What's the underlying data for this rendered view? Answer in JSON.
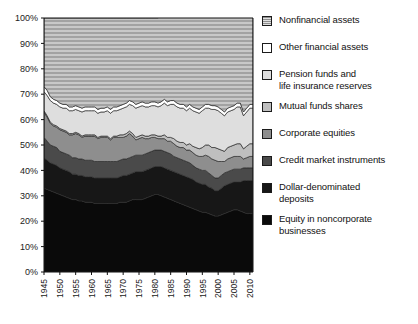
{
  "chart_data": {
    "type": "area",
    "title": "",
    "subtitle": "",
    "xlabel": "",
    "ylabel": "",
    "stacked": true,
    "normalized": true,
    "grid": false,
    "legend_position": "right",
    "xlim": [
      1945,
      2011
    ],
    "ylim": [
      0,
      100
    ],
    "yticks": [
      "0%",
      "10%",
      "20%",
      "30%",
      "40%",
      "50%",
      "60%",
      "70%",
      "80%",
      "90%",
      "100%"
    ],
    "ytick_values": [
      0,
      10,
      20,
      30,
      40,
      50,
      60,
      70,
      80,
      90,
      100
    ],
    "xticks": [
      "1945",
      "1950",
      "1955",
      "1960",
      "1965",
      "1970",
      "1975",
      "1980",
      "1985",
      "1990",
      "1995",
      "2000",
      "2005",
      "2010"
    ],
    "xtick_values": [
      1945,
      1950,
      1955,
      1960,
      1965,
      1970,
      1975,
      1980,
      1985,
      1990,
      1995,
      2000,
      2005,
      2010
    ],
    "x": [
      1945,
      1946,
      1947,
      1948,
      1949,
      1950,
      1951,
      1952,
      1953,
      1954,
      1955,
      1956,
      1957,
      1958,
      1959,
      1960,
      1961,
      1962,
      1963,
      1964,
      1965,
      1966,
      1967,
      1968,
      1969,
      1970,
      1971,
      1972,
      1973,
      1974,
      1975,
      1976,
      1977,
      1978,
      1979,
      1980,
      1981,
      1982,
      1983,
      1984,
      1985,
      1986,
      1987,
      1988,
      1989,
      1990,
      1991,
      1992,
      1993,
      1994,
      1995,
      1996,
      1997,
      1998,
      1999,
      2000,
      2001,
      2002,
      2003,
      2004,
      2005,
      2006,
      2007,
      2008,
      2009,
      2010,
      2011
    ],
    "series": [
      {
        "name": "Equity in noncorporate businesses",
        "color": "#0a0a0a",
        "pattern": "solid",
        "values": [
          33.0,
          32.5,
          32.0,
          31.5,
          31.0,
          30.5,
          30.0,
          29.5,
          29.0,
          28.5,
          28.5,
          28.0,
          28.0,
          27.5,
          27.5,
          27.5,
          27.0,
          27.0,
          27.0,
          27.0,
          27.0,
          27.0,
          27.0,
          27.0,
          27.5,
          27.5,
          27.5,
          28.0,
          28.5,
          28.5,
          28.5,
          28.5,
          29.0,
          29.5,
          30.0,
          30.5,
          30.5,
          30.0,
          29.5,
          29.0,
          28.5,
          28.0,
          27.5,
          27.0,
          26.5,
          26.0,
          25.5,
          25.0,
          24.5,
          24.0,
          23.5,
          23.5,
          23.0,
          22.5,
          22.0,
          22.0,
          22.5,
          23.0,
          23.5,
          24.0,
          24.5,
          24.5,
          24.0,
          23.5,
          23.0,
          23.0,
          23.0
        ]
      },
      {
        "name": "Dollar-denominated deposits",
        "color": "#171717",
        "pattern": "solid",
        "values": [
          12.0,
          11.5,
          11.0,
          11.0,
          11.0,
          10.5,
          10.5,
          10.5,
          10.5,
          10.0,
          10.0,
          10.0,
          10.0,
          10.0,
          10.0,
          10.0,
          10.0,
          10.0,
          10.0,
          10.0,
          10.0,
          10.0,
          10.0,
          10.0,
          10.0,
          10.5,
          10.5,
          10.5,
          10.5,
          11.0,
          11.0,
          11.0,
          11.0,
          11.0,
          11.0,
          11.0,
          11.0,
          11.5,
          11.5,
          11.5,
          11.5,
          11.5,
          11.5,
          11.5,
          11.5,
          11.5,
          11.5,
          11.5,
          11.0,
          11.0,
          11.0,
          11.0,
          10.5,
          10.5,
          10.0,
          10.0,
          10.5,
          11.0,
          11.0,
          11.0,
          11.0,
          11.0,
          11.5,
          12.5,
          13.0,
          13.0,
          13.0
        ]
      },
      {
        "name": "Credit market instruments",
        "color": "#4a4a4a",
        "pattern": "solid",
        "values": [
          8.0,
          7.5,
          7.0,
          7.0,
          7.0,
          6.5,
          6.5,
          6.5,
          6.5,
          6.5,
          6.5,
          6.5,
          6.5,
          6.5,
          6.5,
          6.5,
          6.5,
          6.5,
          6.5,
          6.5,
          6.5,
          6.5,
          6.5,
          6.5,
          6.5,
          6.5,
          6.5,
          6.5,
          6.5,
          6.5,
          6.5,
          6.5,
          6.5,
          6.5,
          6.5,
          6.5,
          6.5,
          6.5,
          6.5,
          6.5,
          6.5,
          6.0,
          6.0,
          6.0,
          6.0,
          6.0,
          6.0,
          5.5,
          5.5,
          5.5,
          5.5,
          5.5,
          5.5,
          5.0,
          5.0,
          5.0,
          5.0,
          5.0,
          5.0,
          5.0,
          5.0,
          5.0,
          5.0,
          5.0,
          5.0,
          5.0,
          5.0
        ]
      },
      {
        "name": "Corporate equities",
        "color": "#8e8e8e",
        "pattern": "solid",
        "values": [
          10.0,
          9.5,
          8.5,
          8.0,
          8.0,
          8.5,
          8.5,
          8.5,
          8.0,
          9.0,
          9.5,
          9.5,
          8.5,
          9.5,
          9.5,
          9.5,
          10.0,
          9.0,
          9.5,
          9.5,
          9.5,
          8.5,
          9.5,
          9.5,
          9.0,
          8.5,
          9.0,
          9.5,
          8.0,
          6.0,
          6.5,
          7.0,
          6.0,
          5.5,
          5.5,
          5.0,
          4.5,
          4.5,
          5.0,
          4.5,
          5.0,
          5.0,
          4.5,
          4.5,
          5.0,
          4.5,
          5.0,
          5.0,
          5.0,
          5.0,
          5.5,
          6.0,
          6.5,
          6.5,
          7.0,
          6.5,
          5.5,
          4.5,
          5.0,
          5.0,
          5.0,
          5.0,
          5.0,
          3.5,
          4.0,
          4.5,
          4.5
        ]
      },
      {
        "name": "Mutual funds shares",
        "color": "#bfbfbf",
        "pattern": "solid",
        "values": [
          0.5,
          0.5,
          0.5,
          0.5,
          0.5,
          0.5,
          0.5,
          0.5,
          0.5,
          0.5,
          0.5,
          0.5,
          0.5,
          0.5,
          0.5,
          0.5,
          0.5,
          0.5,
          0.5,
          0.5,
          0.5,
          0.5,
          0.5,
          0.5,
          1.0,
          1.0,
          1.0,
          1.0,
          1.0,
          1.0,
          1.0,
          1.0,
          1.0,
          1.0,
          1.0,
          1.0,
          1.0,
          1.0,
          1.5,
          1.5,
          1.5,
          2.0,
          2.0,
          2.0,
          2.0,
          2.0,
          2.5,
          2.5,
          3.0,
          3.0,
          3.5,
          4.0,
          4.5,
          4.5,
          5.0,
          5.0,
          4.5,
          4.0,
          4.5,
          4.5,
          4.5,
          5.0,
          5.0,
          4.0,
          4.5,
          5.0,
          5.0
        ]
      },
      {
        "name": "Pension funds and life insurance reserves",
        "color": "#dedede",
        "pattern": "solid",
        "values": [
          7.5,
          8.0,
          8.5,
          8.5,
          8.5,
          8.5,
          8.5,
          9.0,
          9.0,
          9.0,
          9.0,
          9.0,
          9.5,
          9.5,
          9.5,
          9.5,
          9.5,
          9.5,
          9.5,
          9.5,
          10.0,
          10.0,
          10.0,
          10.0,
          10.0,
          10.5,
          10.5,
          10.5,
          11.0,
          11.5,
          11.5,
          11.5,
          11.5,
          11.5,
          11.5,
          11.5,
          11.5,
          12.0,
          12.5,
          12.5,
          13.0,
          13.5,
          13.5,
          13.5,
          13.5,
          13.5,
          14.0,
          14.0,
          14.0,
          14.0,
          14.5,
          14.5,
          14.5,
          15.0,
          15.0,
          15.0,
          14.5,
          14.0,
          14.0,
          14.0,
          14.0,
          14.5,
          14.5,
          13.0,
          13.5,
          14.0,
          14.0
        ]
      },
      {
        "name": "Other financial assets",
        "color": "#ffffff",
        "pattern": "solid",
        "values": [
          2.0,
          2.0,
          1.5,
          1.5,
          1.5,
          1.5,
          1.5,
          1.5,
          1.5,
          1.5,
          1.5,
          1.5,
          1.5,
          1.5,
          1.5,
          1.5,
          1.5,
          1.5,
          1.5,
          1.5,
          1.5,
          1.5,
          1.5,
          1.5,
          1.5,
          1.5,
          1.5,
          1.5,
          1.5,
          1.5,
          1.5,
          1.5,
          1.5,
          1.5,
          1.5,
          1.5,
          1.5,
          1.5,
          1.5,
          1.5,
          1.5,
          1.5,
          1.5,
          1.5,
          1.5,
          1.5,
          1.5,
          1.5,
          1.5,
          1.5,
          1.5,
          1.5,
          1.5,
          1.5,
          1.5,
          1.5,
          1.5,
          1.5,
          1.5,
          1.5,
          1.5,
          1.5,
          1.5,
          1.5,
          1.5,
          1.5,
          1.5
        ]
      },
      {
        "name": "Nonfinancial assets",
        "color": "#b4b4b4",
        "pattern": "horizontal-stripes",
        "values": [
          27.0,
          28.5,
          31.0,
          32.0,
          32.5,
          33.5,
          34.0,
          34.0,
          35.0,
          35.0,
          34.5,
          35.0,
          35.5,
          35.0,
          35.0,
          35.0,
          35.0,
          36.0,
          35.5,
          35.5,
          35.0,
          36.0,
          35.0,
          35.0,
          34.5,
          34.0,
          33.5,
          32.5,
          33.0,
          34.0,
          33.5,
          33.0,
          33.5,
          33.5,
          33.0,
          33.0,
          33.5,
          34.0,
          33.5,
          34.5,
          34.0,
          34.5,
          35.5,
          36.0,
          36.0,
          37.0,
          36.0,
          37.0,
          37.5,
          38.0,
          37.0,
          36.0,
          35.5,
          36.5,
          36.5,
          37.0,
          39.0,
          40.0,
          38.5,
          38.0,
          37.5,
          36.5,
          37.5,
          44.0,
          41.5,
          38.5,
          38.5
        ]
      }
    ]
  },
  "legend": {
    "items": [
      {
        "label": "Nonfinancial assets",
        "swatch": "nonfinancial-assets"
      },
      {
        "label": "Other financial assets",
        "swatch": "other-financial-assets"
      },
      {
        "label": "Pension funds and\nlife insurance reserves",
        "swatch": "pension-funds"
      },
      {
        "label": "Mutual funds shares",
        "swatch": "mutual-funds-shares"
      },
      {
        "label": "Corporate equities",
        "swatch": "corporate-equities"
      },
      {
        "label": "Credit market instruments",
        "swatch": "credit-market-instruments"
      },
      {
        "label": "Dollar-denominated\ndeposits",
        "swatch": "dollar-denominated-deposits"
      },
      {
        "label": "Equity in noncorporate\nbusinesses",
        "swatch": "equity-noncorporate"
      }
    ]
  }
}
